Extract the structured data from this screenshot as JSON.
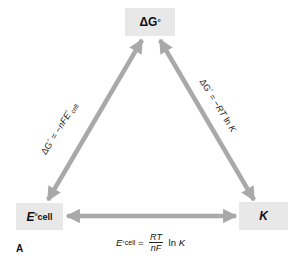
{
  "figure_label": "A",
  "colors": {
    "arrow": "#a9a9a9",
    "node_fill": "#e8e8e8",
    "text": "#111111"
  },
  "nodes": {
    "top": {
      "symbol": "ΔG°",
      "main": "ΔG",
      "sup": "°"
    },
    "bottom_left": {
      "symbol": "E°cell",
      "main": "E",
      "sup": "°",
      "sub": "cell"
    },
    "bottom_right": {
      "symbol": "K",
      "main": "K"
    }
  },
  "edges": {
    "left": {
      "from": "ΔG°",
      "to": "E°cell",
      "equation": "ΔG° = −nFE°cell",
      "parts": {
        "lhs": "ΔG",
        "lhs_sup": "°",
        "eq": " = −",
        "var": "nFE",
        "var_sup": "°",
        "var_sub": "cell"
      }
    },
    "right": {
      "from": "ΔG°",
      "to": "K",
      "equation": "ΔG° = −RT ln K",
      "parts": {
        "lhs": "ΔG",
        "lhs_sup": "°",
        "eq": " = −",
        "var": "RT",
        "ln": " ln ",
        "k": "K"
      }
    },
    "bottom": {
      "from": "E°cell",
      "to": "K",
      "equation": "E°cell = (RT/nF) ln K",
      "parts": {
        "lhs": "E",
        "lhs_sup": "°",
        "lhs_sub": "cell",
        "eq": " = ",
        "num": "RT",
        "den": "nF",
        "ln": " ln ",
        "k": "K"
      }
    }
  }
}
